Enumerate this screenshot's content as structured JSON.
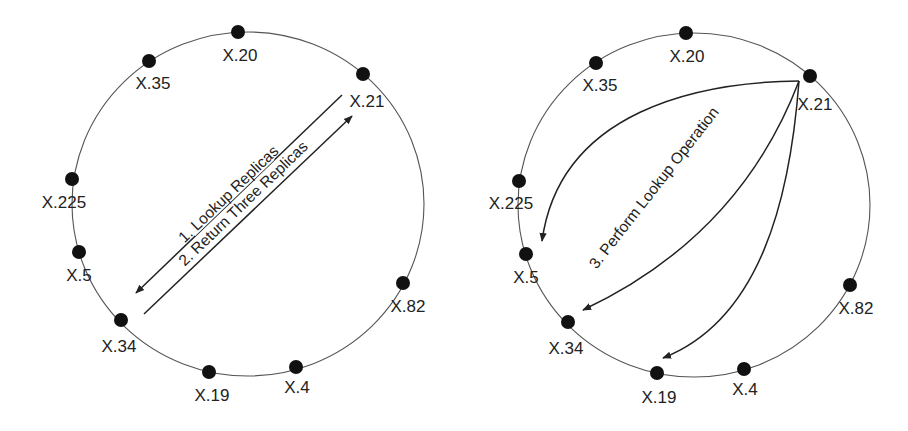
{
  "colors": {
    "background": "#ffffff",
    "ring": "#555555",
    "node": "#111111",
    "text": "#222222"
  },
  "diagrams": [
    {
      "name": "left",
      "nodes": [
        {
          "label": "X.20"
        },
        {
          "label": "X.35"
        },
        {
          "label": "X.21"
        },
        {
          "label": "X.225"
        },
        {
          "label": "X.5"
        },
        {
          "label": "X.34"
        },
        {
          "label": "X.19"
        },
        {
          "label": "X.4"
        },
        {
          "label": "X.82"
        }
      ],
      "edges": [
        {
          "label": "1. Lookup Replicas",
          "from": "X.21",
          "to": "X.34"
        },
        {
          "label": "2. Return Three Replicas",
          "from": "X.34",
          "to": "X.21"
        }
      ]
    },
    {
      "name": "right",
      "nodes": [
        {
          "label": "X.20"
        },
        {
          "label": "X.35"
        },
        {
          "label": "X.21"
        },
        {
          "label": "X.225"
        },
        {
          "label": "X.5"
        },
        {
          "label": "X.34"
        },
        {
          "label": "X.19"
        },
        {
          "label": "X.4"
        },
        {
          "label": "X.82"
        }
      ],
      "edges": [
        {
          "label": "3. Perform Lookup Operation",
          "from": "X.21",
          "to": [
            "X.5",
            "X.34",
            "X.19"
          ]
        }
      ]
    }
  ]
}
